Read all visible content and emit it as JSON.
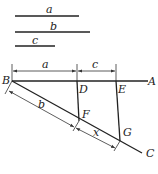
{
  "segments": [
    {
      "label": "a"
    },
    {
      "label": "b"
    },
    {
      "label": "c"
    }
  ],
  "points": {
    "A": "A",
    "B": "B",
    "C": "C",
    "D": "D",
    "E": "E",
    "F": "F",
    "G": "G"
  },
  "dimensions": {
    "BD": "a",
    "DE": "c",
    "BF": "b",
    "FG": "x"
  },
  "colors": {
    "ink": "#222222"
  }
}
